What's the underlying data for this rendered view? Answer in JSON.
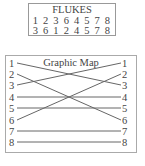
{
  "flukes": {
    "title": "FLUKES",
    "row1": "1 2 3 6 4 5 7 8",
    "row2": "3 6 1 2 4 5 7 8"
  },
  "graphic_map": {
    "title": "Graphic Map",
    "left_labels": [
      "1",
      "2",
      "3",
      "4",
      "5",
      "6",
      "7",
      "8"
    ],
    "right_labels": [
      "1",
      "2",
      "3",
      "4",
      "5",
      "6",
      "7",
      "8"
    ],
    "connections": [
      {
        "from": 1,
        "to": 3
      },
      {
        "from": 2,
        "to": 6
      },
      {
        "from": 3,
        "to": 1
      },
      {
        "from": 4,
        "to": 4
      },
      {
        "from": 5,
        "to": 5
      },
      {
        "from": 6,
        "to": 2
      },
      {
        "from": 7,
        "to": 7
      },
      {
        "from": 8,
        "to": 8
      }
    ]
  }
}
